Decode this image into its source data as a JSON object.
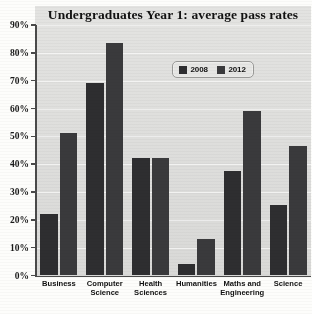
{
  "chart_data": {
    "type": "bar",
    "title": "Undergraduates Year 1: average pass rates",
    "xlabel": "",
    "ylabel": "",
    "ylim": [
      0,
      90
    ],
    "ytick_labels": [
      "90%",
      "80%",
      "70%",
      "60%",
      "50%",
      "40%",
      "30%",
      "20%",
      "10%",
      "0%"
    ],
    "ytick_values": [
      90,
      80,
      70,
      60,
      50,
      40,
      30,
      20,
      10,
      0
    ],
    "grid": true,
    "legend_position": "top-center-right",
    "categories": [
      "Business",
      "Computer Science",
      "Health Sciences",
      "Humanities",
      "Maths and Engineering",
      "Science"
    ],
    "category_lines": [
      [
        "Business"
      ],
      [
        "Computer",
        "Science"
      ],
      [
        "Health",
        "Sciences"
      ],
      [
        "Humanities"
      ],
      [
        "Maths and",
        "Engineering"
      ],
      [
        "Science"
      ]
    ],
    "series": [
      {
        "name": "2008",
        "color": "#2e2e30",
        "values": [
          22,
          69,
          42,
          4,
          37.5,
          25
        ]
      },
      {
        "name": "2012",
        "color": "#3a3a3c",
        "values": [
          51,
          83.5,
          42,
          13,
          59,
          46.5
        ]
      }
    ]
  },
  "legend": {
    "entries": [
      {
        "label": "2008",
        "color": "#2e2e30"
      },
      {
        "label": "2012",
        "color": "#3a3a3c"
      }
    ]
  },
  "colors": {
    "plot_background": "#dededc",
    "page_background": "#fdfdfb",
    "axis": "#4a4a4a",
    "gridline": "#ffffff",
    "series_2008": "#2e2e30",
    "series_2012": "#3a3a3c"
  }
}
